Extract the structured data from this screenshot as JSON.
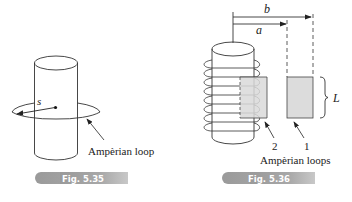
{
  "figures": [
    {
      "id": "fig-5-35",
      "caption": "Fig. 5.35",
      "labels": {
        "radius": "s",
        "loop": "Ampèrian loop"
      }
    },
    {
      "id": "fig-5-36",
      "caption": "Fig. 5.36",
      "labels": {
        "distance_b": "b",
        "distance_a": "a",
        "length": "L",
        "loop_2": "2",
        "loop_1": "1",
        "loops": "Ampèrian loops"
      }
    }
  ],
  "colors": {
    "caption_bar": "#a6a6a6",
    "loop_fill": "#dcdcdc",
    "stroke": "#333333"
  }
}
